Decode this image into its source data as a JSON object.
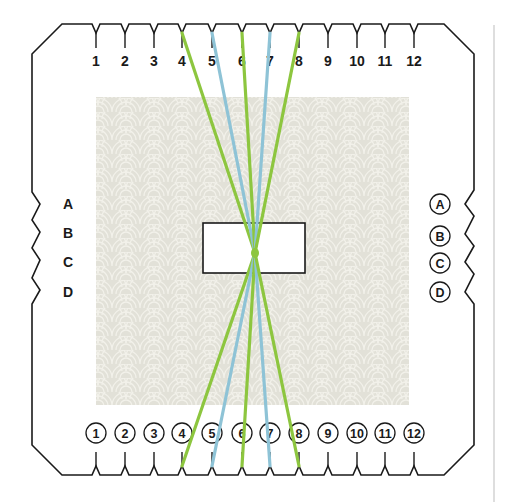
{
  "card": {
    "outline_color": "#1a1a1a",
    "background": "#ffffff"
  },
  "pattern": {
    "base_color": "#e2e1d8",
    "scallop_color": "#f2f1ea"
  },
  "divider": {
    "color": "#bdbdbd"
  },
  "threads": {
    "colors": {
      "green": "#8dc63f",
      "blue": "#8ec3d6"
    },
    "list": [
      {
        "top_slot": "4",
        "bottom_slot": "4",
        "color": "green"
      },
      {
        "top_slot": "5",
        "bottom_slot": "5",
        "color": "blue"
      },
      {
        "top_slot": "6",
        "bottom_slot": "6",
        "color": "green"
      },
      {
        "top_slot": "7",
        "bottom_slot": "7",
        "color": "blue"
      },
      {
        "top_slot": "8",
        "bottom_slot": "8",
        "color": "green"
      }
    ]
  },
  "top_slots": [
    "1",
    "2",
    "3",
    "4",
    "5",
    "6",
    "7",
    "8",
    "9",
    "10",
    "11",
    "12"
  ],
  "bottom_slots": [
    "1",
    "2",
    "3",
    "4",
    "5",
    "6",
    "7",
    "8",
    "9",
    "10",
    "11",
    "12"
  ],
  "left_slots": [
    "A",
    "B",
    "C",
    "D"
  ],
  "right_slots": [
    "A",
    "B",
    "C",
    "D"
  ]
}
